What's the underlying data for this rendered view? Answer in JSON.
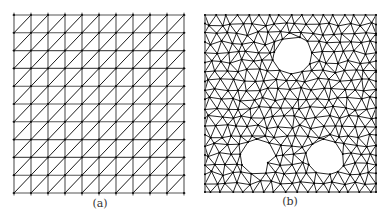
{
  "figure": {
    "panels": [
      {
        "id": "a",
        "caption": "(a)",
        "type": "structured-triangular-mesh",
        "description": "Uniform square grid with each square split by a diagonal",
        "bounds": {
          "x0": 14,
          "y0": 15,
          "x1": 184,
          "y1": 193
        },
        "cols": 10,
        "rows": 10,
        "diagonal": "bottom-left-to-top-right",
        "stroke_color": "#1a1a1a",
        "grid_color": "#555555"
      },
      {
        "id": "b",
        "caption": "(b)",
        "type": "unstructured-triangular-mesh",
        "description": "Irregular triangulation of a square domain with three circular holes",
        "bounds": {
          "x0": 12,
          "y0": 15,
          "x1": 183,
          "y1": 192
        },
        "target_spacing": 11,
        "holes": [
          {
            "cx": 100,
            "cy": 55,
            "r": 19
          },
          {
            "cx": 65,
            "cy": 157,
            "r": 18
          },
          {
            "cx": 132,
            "cy": 157,
            "r": 18
          }
        ],
        "stroke_color": "#1a1a1a",
        "border_color": "#999999",
        "node_color": "#000000"
      }
    ]
  }
}
